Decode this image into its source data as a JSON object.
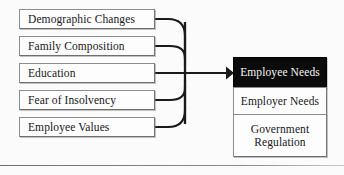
{
  "diagram": {
    "type": "flow-diagram",
    "colors": {
      "background": "#fbfbfb",
      "box_fill": "#fdfdfd",
      "box_border": "#8d8d8d",
      "highlight_fill": "#0b0b0b",
      "highlight_text": "#f4f4f4",
      "text": "#17171a",
      "connector": "#1a1a1a"
    }
  },
  "inputs": {
    "label": "Influencing factors",
    "items": [
      {
        "id": "demographic-changes",
        "label": "Demographic Changes"
      },
      {
        "id": "family-composition",
        "label": "Family Composition"
      },
      {
        "id": "education",
        "label": "Education"
      },
      {
        "id": "fear-of-insolvency",
        "label": "Fear of Insolvency"
      },
      {
        "id": "employee-values",
        "label": "Employee Values"
      }
    ]
  },
  "outputs": {
    "label": "Needs stack",
    "items": [
      {
        "id": "employee-needs",
        "label": "Employee Needs",
        "highlighted": true
      },
      {
        "id": "employer-needs",
        "label": "Employer Needs",
        "highlighted": false
      },
      {
        "id": "government-regulation",
        "label": "Government\nRegulation",
        "highlighted": false
      }
    ]
  },
  "connector": {
    "id": "merge-arrow",
    "description": "Curved connectors from the five factor boxes merge into a vertical bus and a single arrow pointing at Employee Needs",
    "arrow_target": "employee-needs"
  }
}
